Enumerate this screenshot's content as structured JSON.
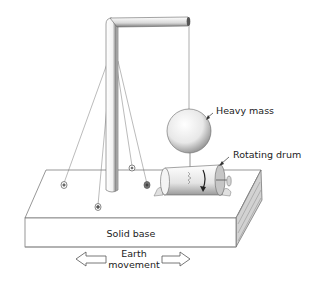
{
  "diagram": {
    "labels": {
      "heavy_mass": "Heavy mass",
      "rotating_drum": "Rotating drum",
      "solid_base": "Solid base",
      "earth_movement_line1": "Earth",
      "earth_movement_line2": "movement"
    },
    "colors": {
      "line": "#555555",
      "shade": "#9a9a9a",
      "text": "#222222",
      "background": "#ffffff"
    }
  }
}
